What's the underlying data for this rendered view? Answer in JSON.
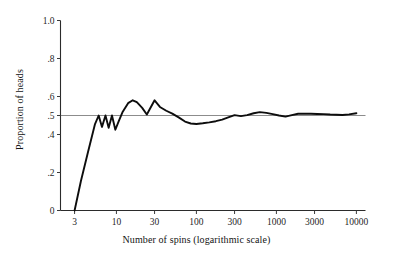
{
  "chart_data": {
    "type": "line",
    "title": "",
    "subtitle": "",
    "xlabel": "Number of spins (logarithmic scale)",
    "ylabel": "Proportion of heads",
    "xscale": "log",
    "yscale": "linear",
    "xlim": [
      2.0,
      13000
    ],
    "ylim": [
      0,
      1.0
    ],
    "grid": false,
    "legend": null,
    "xticks": [
      3,
      10,
      30,
      100,
      300,
      1000,
      3000,
      10000
    ],
    "xticklabels": [
      "3",
      "10",
      "30",
      "100",
      "300",
      "1000",
      "3000",
      "10000"
    ],
    "yticks": [
      0,
      0.2,
      0.4,
      0.5,
      0.6,
      0.8,
      1.0
    ],
    "yticklabels": [
      "0",
      ".2",
      ".4",
      ".5",
      ".6",
      ".8",
      "1.0"
    ],
    "annotations": [
      {
        "name": "reference-line",
        "type": "hline",
        "y": 0.5,
        "color": "#8c8c8c",
        "label": ""
      }
    ],
    "series": [
      {
        "name": "Proportion of heads",
        "color": "#0d0d0d",
        "x": [
          3,
          3.6,
          4.4,
          5.4,
          6.0,
          6.6,
          7.3,
          8.0,
          8.8,
          9.7,
          10.7,
          12,
          14,
          16,
          18,
          21,
          24,
          27,
          30,
          35,
          42,
          50,
          60,
          72,
          85,
          100,
          120,
          145,
          175,
          210,
          250,
          300,
          360,
          430,
          520,
          620,
          750,
          900,
          1080,
          1300,
          1560,
          1870,
          2250,
          2700,
          3250,
          3900,
          4700,
          5600,
          6700,
          8100,
          10000
        ],
        "y": [
          0.0,
          0.155,
          0.305,
          0.455,
          0.5,
          0.44,
          0.5,
          0.435,
          0.5,
          0.425,
          0.47,
          0.52,
          0.565,
          0.58,
          0.57,
          0.54,
          0.505,
          0.545,
          0.58,
          0.545,
          0.525,
          0.51,
          0.49,
          0.468,
          0.458,
          0.455,
          0.459,
          0.464,
          0.47,
          0.478,
          0.49,
          0.502,
          0.497,
          0.502,
          0.512,
          0.518,
          0.514,
          0.507,
          0.5,
          0.494,
          0.502,
          0.509,
          0.51,
          0.509,
          0.508,
          0.507,
          0.505,
          0.504,
          0.503,
          0.506,
          0.512
        ]
      }
    ]
  }
}
